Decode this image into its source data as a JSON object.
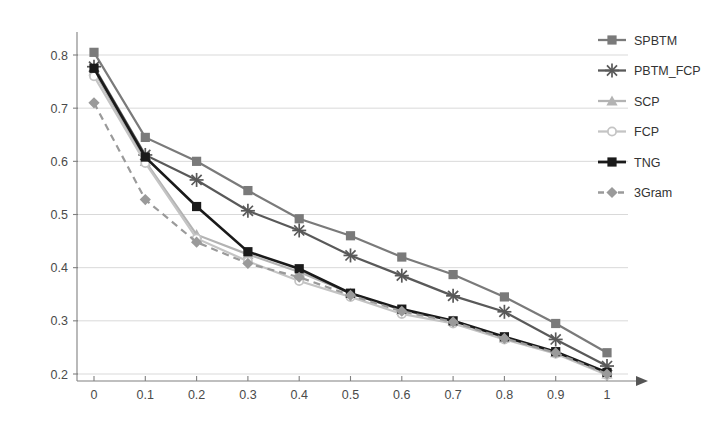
{
  "chart_data": {
    "type": "line",
    "title": "",
    "xlabel": "",
    "ylabel": "",
    "xlim": [
      0,
      1
    ],
    "ylim": [
      0.2,
      0.8
    ],
    "grid": true,
    "legend_position": "right",
    "x": [
      0,
      0.1,
      0.2,
      0.3,
      0.4,
      0.5,
      0.6,
      0.7,
      0.8,
      0.9,
      1
    ],
    "xticklabels": [
      "0",
      "0.1",
      "0.2",
      "0.3",
      "0.4",
      "0.5",
      "0.6",
      "0.7",
      "0.8",
      "0.9",
      "1"
    ],
    "yticklabels": [
      "0.2",
      "0.3",
      "0.4",
      "0.5",
      "0.6",
      "0.7",
      "0.8"
    ],
    "yticks": [
      0.2,
      0.3,
      0.4,
      0.5,
      0.6,
      0.7,
      0.8
    ],
    "series": [
      {
        "name": "SPBTM",
        "color": "#7a7a7a",
        "marker": "square",
        "dash": "solid",
        "values": [
          0.805,
          0.645,
          0.6,
          0.545,
          0.492,
          0.46,
          0.42,
          0.387,
          0.345,
          0.295,
          0.24
        ]
      },
      {
        "name": "PBTM_FCP",
        "color": "#595959",
        "marker": "asterisk",
        "dash": "solid",
        "values": [
          0.778,
          0.612,
          0.565,
          0.507,
          0.47,
          0.423,
          0.385,
          0.347,
          0.317,
          0.265,
          0.215
        ]
      },
      {
        "name": "SCP",
        "color": "#b3b3b3",
        "marker": "triangle",
        "dash": "solid",
        "values": [
          0.77,
          0.6,
          0.462,
          0.425,
          0.392,
          0.352,
          0.32,
          0.3,
          0.268,
          0.24,
          0.2
        ]
      },
      {
        "name": "FCP",
        "color": "#c4c4c4",
        "marker": "circle-open",
        "dash": "solid",
        "values": [
          0.76,
          0.597,
          0.455,
          0.412,
          0.375,
          0.345,
          0.313,
          0.295,
          0.265,
          0.238,
          0.198
        ]
      },
      {
        "name": "TNG",
        "color": "#1a1a1a",
        "marker": "square",
        "dash": "solid",
        "values": [
          0.775,
          0.608,
          0.515,
          0.43,
          0.398,
          0.352,
          0.322,
          0.3,
          0.27,
          0.242,
          0.203
        ]
      },
      {
        "name": "3Gram",
        "color": "#9a9a9a",
        "marker": "diamond",
        "dash": "dashed",
        "values": [
          0.71,
          0.528,
          0.448,
          0.408,
          0.382,
          0.348,
          0.318,
          0.298,
          0.267,
          0.24,
          0.2
        ]
      }
    ]
  },
  "legend": {
    "items": [
      {
        "label": "SPBTM"
      },
      {
        "label": "PBTM_FCP"
      },
      {
        "label": "SCP"
      },
      {
        "label": "FCP"
      },
      {
        "label": "TNG"
      },
      {
        "label": "3Gram"
      }
    ]
  }
}
